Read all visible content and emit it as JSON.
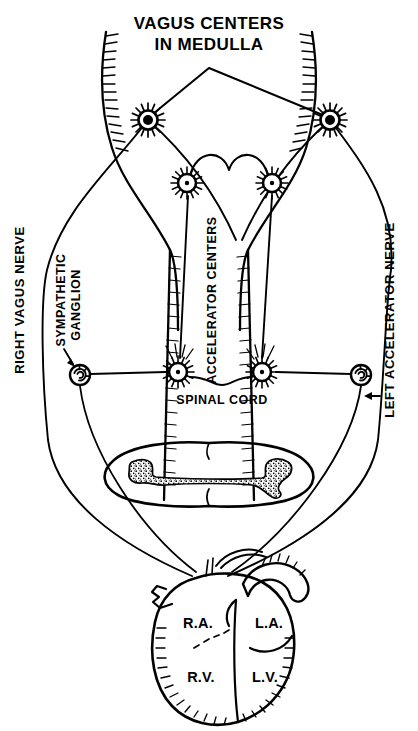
{
  "figure": {
    "title_line1": "VAGUS CENTERS",
    "title_line2": "IN MEDULLA",
    "type": "anatomical-diagram"
  },
  "labels": {
    "right_vagus_nerve": "RIGHT VAGUS NERVE",
    "left_accelerator_nerve": "LEFT ACCELERATOR NERVE",
    "sympathetic_ganglion_line1": "SYMPATHETIC",
    "sympathetic_ganglion_line2": "GANGLION",
    "accelerator_centers": "ACCELERATOR CENTERS",
    "spinal_cord": "SPINAL CORD"
  },
  "heart": {
    "chambers": [
      {
        "name": "right-atrium",
        "label": "R.A."
      },
      {
        "name": "left-atrium",
        "label": "L.A."
      },
      {
        "name": "right-ventricle",
        "label": "R.V."
      },
      {
        "name": "left-ventricle",
        "label": "L.V."
      }
    ]
  },
  "structures": {
    "vagus_center_neurons": 2,
    "accelerator_center_neurons": 2,
    "cord_level_neurons": 2,
    "ganglia": 2
  },
  "colors": {
    "ink": "#000000",
    "background": "#ffffff"
  }
}
